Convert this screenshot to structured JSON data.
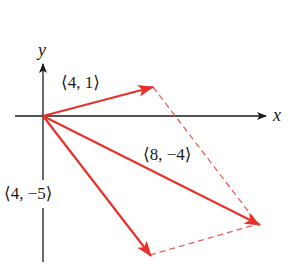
{
  "diagram": {
    "axes": {
      "x_label": "x",
      "y_label": "y"
    },
    "vectors": [
      {
        "label": "⟨4, 1⟩",
        "components": [
          4,
          1
        ]
      },
      {
        "label": "⟨4, −5⟩",
        "components": [
          4,
          -5
        ]
      },
      {
        "label": "⟨8, −4⟩",
        "components": [
          8,
          -4
        ],
        "role": "sum"
      }
    ],
    "colors": {
      "vector": "#e8312a",
      "dashed": "#e8615a",
      "axis": "#1a1a1a"
    }
  }
}
